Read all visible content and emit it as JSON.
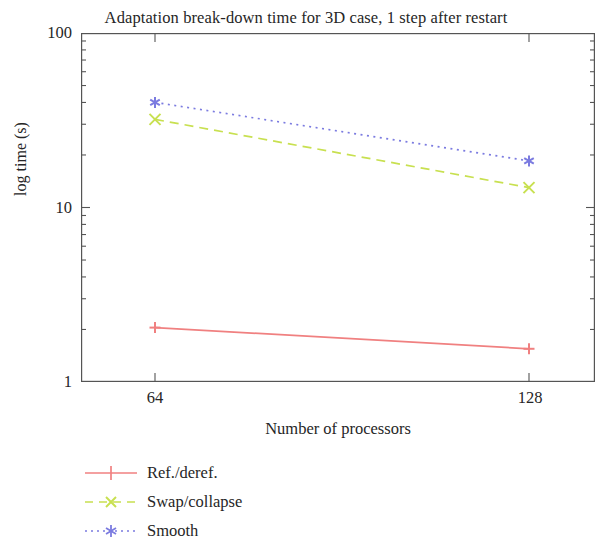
{
  "chart_data": {
    "type": "line",
    "title": "Adaptation break-down time for 3D case, 1 step after restart",
    "xlabel": "Number of processors",
    "ylabel": "log time (s)",
    "yscale": "log",
    "ylim": [
      1,
      100
    ],
    "y_ticks": [
      "1",
      "10",
      "100"
    ],
    "y_tick_values": [
      1,
      10,
      100
    ],
    "x": [
      64,
      128
    ],
    "x_ticks": [
      "64",
      "128"
    ],
    "grid": "off",
    "legend_position": "below-left",
    "series": [
      {
        "name": "Ref./deref.",
        "values": [
          2.05,
          1.55
        ],
        "color": "#f08080",
        "marker": "plus",
        "linestyle": "solid"
      },
      {
        "name": "Swap/collapse",
        "values": [
          32,
          13
        ],
        "color": "#c8e050",
        "marker": "cross",
        "linestyle": "dashed"
      },
      {
        "name": "Smooth",
        "values": [
          40,
          18.5
        ],
        "color": "#7b7be0",
        "marker": "asterisk",
        "linestyle": "dotted"
      }
    ]
  },
  "axes": {
    "frame_color": "#555555"
  }
}
